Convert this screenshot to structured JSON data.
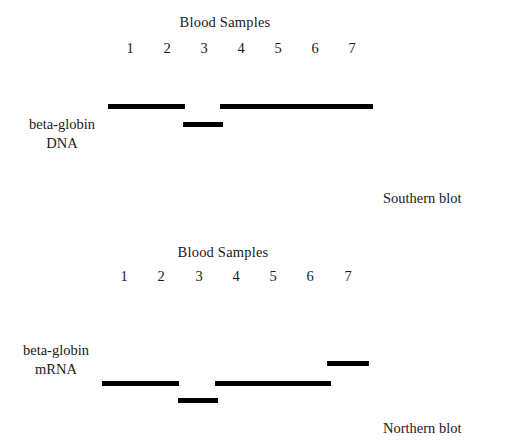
{
  "figure": {
    "lane_width": 44,
    "band_width": 44,
    "panels": [
      {
        "id": "southern",
        "samples_title": "Blood Samples",
        "title_left": 170,
        "title_top": 14,
        "title_width": 110,
        "lane_numbers_top": 38,
        "lane_numbers_left": 0,
        "lanes": [
          {
            "label": "1",
            "x": 130
          },
          {
            "label": "2",
            "x": 167
          },
          {
            "label": "3",
            "x": 204
          },
          {
            "label": "4",
            "x": 241
          },
          {
            "label": "5",
            "x": 278
          },
          {
            "label": "6",
            "x": 315
          },
          {
            "label": "7",
            "x": 352
          }
        ],
        "gel_top": 95,
        "gel_height": 50,
        "bands": [
          {
            "lane": "1",
            "x": 130,
            "y": 9,
            "w": 40
          },
          {
            "lane": "2",
            "x": 167,
            "y": 9,
            "w": 40
          },
          {
            "lane": "3",
            "x": 205,
            "y": 27,
            "w": 40
          },
          {
            "lane": "4",
            "x": 242,
            "y": 9,
            "w": 42
          },
          {
            "lane": "5",
            "x": 279,
            "y": 9,
            "w": 42
          },
          {
            "lane": "6",
            "x": 316,
            "y": 9,
            "w": 42
          },
          {
            "lane": "7",
            "x": 353,
            "y": 9,
            "w": 42
          }
        ],
        "row_label_line1": "beta-globin",
        "row_label_line2": "DNA",
        "row_label_left": 14,
        "row_label_top": 115,
        "row_label_width": 96,
        "caption": "Southern blot",
        "caption_left": 383,
        "caption_top": 190
      },
      {
        "id": "northern",
        "samples_title": "Blood Samples",
        "title_left": 168,
        "title_top": 16,
        "title_width": 110,
        "lane_numbers_top": 38,
        "lane_numbers_left": 0,
        "lanes": [
          {
            "label": "1",
            "x": 124
          },
          {
            "label": "2",
            "x": 161
          },
          {
            "label": "3",
            "x": 199
          },
          {
            "label": "4",
            "x": 236
          },
          {
            "label": "5",
            "x": 273
          },
          {
            "label": "6",
            "x": 310
          },
          {
            "label": "7",
            "x": 348
          }
        ],
        "gel_top": 125,
        "gel_height": 60,
        "bands": [
          {
            "lane": "1",
            "x": 124,
            "y": 28,
            "w": 40
          },
          {
            "lane": "2",
            "x": 161,
            "y": 28,
            "w": 40
          },
          {
            "lane": "3",
            "x": 200,
            "y": 45,
            "w": 40
          },
          {
            "lane": "4",
            "x": 237,
            "y": 28,
            "w": 42
          },
          {
            "lane": "5",
            "x": 274,
            "y": 28,
            "w": 42
          },
          {
            "lane": "6",
            "x": 311,
            "y": 28,
            "w": 42
          },
          {
            "lane": "7",
            "x": 349,
            "y": 8,
            "w": 42
          }
        ],
        "row_label_line1": "beta-globin",
        "row_label_line2": "mRNA",
        "row_label_left": 8,
        "row_label_top": 113,
        "row_label_width": 96,
        "caption": "Northern blot",
        "caption_left": 383,
        "caption_top": 192
      }
    ]
  },
  "chart_data": {
    "type": "table",
    "xlabel": "Blood Samples",
    "ylabel": "Relative migration position",
    "categories": [
      "1",
      "2",
      "3",
      "4",
      "5",
      "6",
      "7"
    ],
    "series": [
      {
        "name": "beta-globin DNA (Southern blot)",
        "band_positions": [
          "normal",
          "normal",
          "low",
          "normal",
          "normal",
          "normal",
          "normal"
        ],
        "values": [
          0,
          0,
          -1,
          0,
          0,
          0,
          0
        ]
      },
      {
        "name": "beta-globin mRNA (Northern blot)",
        "band_positions": [
          "normal",
          "normal",
          "low",
          "normal",
          "normal",
          "normal",
          "high"
        ],
        "values": [
          0,
          0,
          -1,
          0,
          0,
          0,
          1
        ]
      }
    ],
    "legend_position": "right",
    "grid": false,
    "annotations": [
      "Southern blot",
      "Northern blot",
      "Blood Samples"
    ]
  }
}
